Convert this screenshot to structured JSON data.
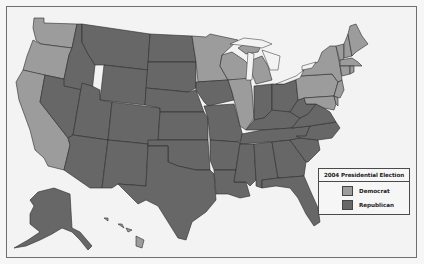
{
  "legend": {
    "title": "2004 Presidential Election",
    "items": [
      {
        "label": "Democrat",
        "color": "#9c9c9c"
      },
      {
        "label": "Republican",
        "color": "#676767"
      }
    ]
  },
  "colors": {
    "democrat": "#9c9c9c",
    "republican": "#676767",
    "background": "#f3f3f3",
    "border": "#2a2a2a"
  },
  "states": {
    "democrat": [
      "WA",
      "OR",
      "CA",
      "MN",
      "WI",
      "MI",
      "IL",
      "PA",
      "NY",
      "VT",
      "NH",
      "ME",
      "MA",
      "RI",
      "CT",
      "NJ",
      "DE",
      "MD",
      "HI"
    ],
    "republican": [
      "ID",
      "MT",
      "WY",
      "NV",
      "UT",
      "CO",
      "AZ",
      "NM",
      "ND",
      "SD",
      "NE",
      "KS",
      "OK",
      "TX",
      "IA",
      "MO",
      "AR",
      "LA",
      "IN",
      "OH",
      "KY",
      "TN",
      "MS",
      "AL",
      "GA",
      "FL",
      "SC",
      "NC",
      "VA",
      "WV",
      "AK"
    ]
  }
}
